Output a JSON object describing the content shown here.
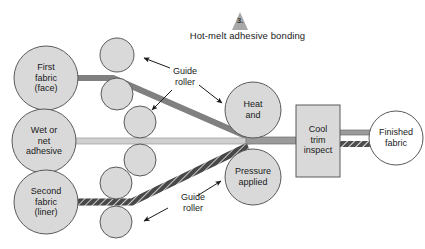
{
  "diagram": {
    "step_number": "3.",
    "title": "Hot-melt adhesive bonding",
    "colors": {
      "circle_fill": "#d9d9d9",
      "circle_stroke": "#5a5a5a",
      "face_web": "#8a8a8a",
      "adhesive_web": "#c9c9c9",
      "liner_web": "#4d4d4d",
      "box_fill": "#d9d9d9",
      "finished_fill": "#ffffff",
      "text": "#1a1a1a"
    },
    "nodes": {
      "first_fabric": "First\nfabric\n(face)",
      "wet_adhesive": "Wet or\nnet\nadhesive",
      "second_fabric": "Second\nfabric\n(liner)",
      "heat": "Heat\nand",
      "pressure": "Pressure\napplied",
      "cool_trim": "Cool\ntrim\ninspect",
      "finished": "Finished\nfabric"
    },
    "annotations": {
      "guide_roller_top": "Guide\nroller",
      "guide_roller_bottom": "Guide\nroller"
    },
    "rollers": {
      "count": 8,
      "label": "guide-roller"
    }
  }
}
